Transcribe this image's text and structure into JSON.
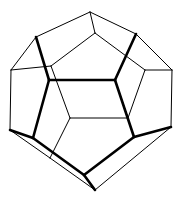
{
  "figure": {
    "stroke_color": "#000000",
    "background": "#ffffff",
    "vertices": {
      "A": [
        90,
        12
      ],
      "B": [
        95,
        33
      ],
      "C": [
        36,
        37
      ],
      "D": [
        136,
        34
      ],
      "E": [
        11,
        70
      ],
      "F": [
        172,
        70
      ],
      "G": [
        51,
        66
      ],
      "H": [
        145,
        70
      ],
      "I": [
        49,
        80
      ],
      "J": [
        115,
        80
      ],
      "K": [
        10,
        130
      ],
      "L": [
        171,
        127
      ],
      "M": [
        70,
        118
      ],
      "N": [
        128,
        118
      ],
      "O": [
        33,
        138
      ],
      "P": [
        134,
        137
      ],
      "Q": [
        50,
        158
      ],
      "R": [
        84,
        175
      ],
      "S": [
        95,
        190
      ]
    },
    "edges_thin": [
      [
        "A",
        "C"
      ],
      [
        "A",
        "D"
      ],
      [
        "A",
        "B"
      ],
      [
        "B",
        "G"
      ],
      [
        "B",
        "H"
      ],
      [
        "C",
        "E"
      ],
      [
        "D",
        "F"
      ],
      [
        "E",
        "G"
      ],
      [
        "F",
        "H"
      ],
      [
        "E",
        "K"
      ],
      [
        "F",
        "L"
      ],
      [
        "G",
        "M"
      ],
      [
        "H",
        "N"
      ],
      [
        "M",
        "N"
      ],
      [
        "M",
        "Q"
      ],
      [
        "K",
        "Q"
      ],
      [
        "L",
        "S"
      ],
      [
        "Q",
        "S"
      ],
      [
        "N",
        "J"
      ]
    ],
    "edges_thick": [
      [
        "C",
        "I"
      ],
      [
        "D",
        "J"
      ],
      [
        "I",
        "J"
      ],
      [
        "I",
        "O"
      ],
      [
        "J",
        "P"
      ],
      [
        "K",
        "O"
      ],
      [
        "O",
        "R"
      ],
      [
        "P",
        "R"
      ],
      [
        "P",
        "L"
      ],
      [
        "R",
        "S"
      ]
    ]
  }
}
